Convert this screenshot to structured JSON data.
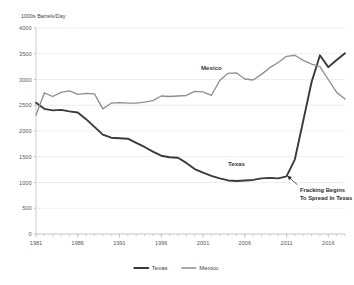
{
  "chart_data": {
    "type": "line",
    "title": "",
    "subtitle": "",
    "xlabel": "",
    "ylabel": "1000s Barrels/Day",
    "ylim": [
      0,
      4000
    ],
    "xlim": [
      1981,
      2018
    ],
    "y_ticks": [
      0,
      500,
      1000,
      1500,
      2000,
      2500,
      3000,
      3500,
      4000
    ],
    "y_tick_labels": [
      "0",
      "500",
      "1000",
      "1500",
      "2000",
      "2500",
      "3000",
      "3500",
      "4000"
    ],
    "x_ticks": [
      1981,
      1986,
      1991,
      1996,
      2001,
      2006,
      2011,
      2016
    ],
    "x_tick_labels": [
      "1981",
      "1986",
      "1991",
      "1996",
      "2001",
      "2006",
      "2011",
      "2016"
    ],
    "grid": "horizontal",
    "legend_position": "bottom",
    "x": [
      1981,
      1982,
      1983,
      1984,
      1985,
      1986,
      1987,
      1988,
      1989,
      1990,
      1991,
      1992,
      1993,
      1994,
      1995,
      1996,
      1997,
      1998,
      1999,
      2000,
      2001,
      2002,
      2003,
      2004,
      2005,
      2006,
      2007,
      2008,
      2009,
      2010,
      2011,
      2012,
      2013,
      2014,
      2015,
      2016,
      2017,
      2018
    ],
    "series": [
      {
        "name": "Texas",
        "color": "#3a3a3a",
        "width": 1.9,
        "inline_label": "Texas",
        "inline_label_x": 2005,
        "inline_label_y": 1320,
        "values": [
          2550,
          2430,
          2400,
          2410,
          2380,
          2360,
          2230,
          2080,
          1930,
          1870,
          1860,
          1850,
          1770,
          1690,
          1600,
          1520,
          1490,
          1480,
          1380,
          1260,
          1190,
          1130,
          1080,
          1040,
          1030,
          1040,
          1050,
          1080,
          1090,
          1080,
          1120,
          1450,
          2200,
          2950,
          3470,
          3240,
          3380,
          3510
        ]
      },
      {
        "name": "Mexico",
        "color": "#8f8f8f",
        "width": 1.35,
        "inline_label": "Mexico",
        "inline_label_x": 2002,
        "inline_label_y": 3180,
        "values": [
          2310,
          2740,
          2670,
          2750,
          2780,
          2710,
          2730,
          2720,
          2430,
          2540,
          2550,
          2540,
          2540,
          2560,
          2590,
          2680,
          2670,
          2680,
          2690,
          2770,
          2760,
          2690,
          2980,
          3120,
          3130,
          3010,
          2990,
          3100,
          3230,
          3330,
          3450,
          3470,
          3370,
          3300,
          3250,
          3000,
          2750,
          2620
        ]
      }
    ],
    "annotations": [
      {
        "text_lines": [
          "Fracking Begins",
          "To Spread In Texas"
        ],
        "arrow_tip_x": 2011.1,
        "arrow_tip_y": 1130,
        "text_x": 2012.6,
        "text_y": 810
      }
    ],
    "legend": [
      {
        "label": "Texas",
        "color": "#3a3a3a",
        "width": 1.9
      },
      {
        "label": "Mexico",
        "color": "#8f8f8f",
        "width": 1.35
      }
    ]
  },
  "colors": {
    "texas": "#3a3a3a",
    "mexico": "#8f8f8f",
    "grid": "#e2e2e2",
    "axis": "#b9b9b9",
    "background": "#ffffff"
  }
}
